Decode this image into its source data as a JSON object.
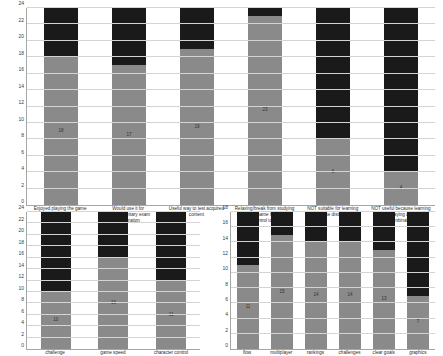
{
  "chart_data": [
    {
      "id": "perceptions",
      "type": "bar",
      "stacked": true,
      "title": "",
      "xlabel": "",
      "ylabel": "",
      "ylim": [
        0,
        24
      ],
      "ytick_step": 2,
      "yticks": [
        0,
        2,
        4,
        6,
        8,
        10,
        12,
        14,
        16,
        18,
        20,
        22,
        24
      ],
      "grid": true,
      "legend": "none",
      "categories": [
        "Enjoyed playing the game",
        "Would use it for complementary exam preparation",
        "Useful way to test acquired content",
        "Relaxing/break from studying but at the same time useful control tool",
        "NOT suitable for learning because distraction",
        "NOT useful because learning and playing are not combinable"
      ],
      "series": [
        {
          "name": "agree",
          "color": "#8a8a8a",
          "values": [
            18,
            17,
            19,
            23,
            8,
            4
          ],
          "labels": [
            "18",
            "17",
            "19",
            "23",
            "6",
            "4"
          ]
        },
        {
          "name": "remainder",
          "color": "#1a1a1a",
          "values": [
            6,
            7,
            5,
            1,
            16,
            20
          ],
          "labels": [
            "",
            "",
            "",
            "",
            "",
            ""
          ]
        }
      ]
    },
    {
      "id": "gameplay",
      "type": "bar",
      "stacked": true,
      "title": "",
      "xlabel": "",
      "ylabel": "",
      "ylim": [
        0,
        24
      ],
      "ytick_step": 2,
      "yticks": [
        0,
        2,
        4,
        6,
        8,
        10,
        12,
        14,
        16,
        18,
        20,
        22,
        24
      ],
      "grid": true,
      "legend": "none",
      "categories": [
        "challenge",
        "game speed",
        "character control"
      ],
      "series": [
        {
          "name": "agree",
          "color": "#8a8a8a",
          "values": [
            10,
            16,
            12
          ],
          "labels": [
            "10",
            "16",
            "11"
          ]
        },
        {
          "name": "remainder",
          "color": "#1a1a1a",
          "values": [
            14,
            8,
            12
          ],
          "labels": [
            "",
            "",
            ""
          ]
        }
      ]
    },
    {
      "id": "features",
      "type": "bar",
      "stacked": true,
      "title": "",
      "xlabel": "",
      "ylabel": "",
      "ylim": [
        0,
        18
      ],
      "ytick_step": 2,
      "yticks": [
        0,
        2,
        4,
        6,
        8,
        10,
        12,
        14,
        16,
        18
      ],
      "grid": true,
      "legend": "none",
      "categories": [
        "flow",
        "multiplayer",
        "rankings",
        "challenges",
        "clear goals",
        "graphics"
      ],
      "series": [
        {
          "name": "agree",
          "color": "#8a8a8a",
          "values": [
            11,
            15,
            14,
            14,
            13,
            7
          ],
          "labels": [
            "11",
            "15",
            "14",
            "14",
            "13",
            "7"
          ]
        },
        {
          "name": "remainder",
          "color": "#1a1a1a",
          "values": [
            7,
            3,
            4,
            4,
            5,
            11
          ],
          "labels": [
            "",
            "",
            "",
            "",
            "",
            ""
          ]
        }
      ]
    }
  ],
  "colors": {
    "series_gray": "#8a8a8a",
    "series_dark": "#1a1a1a",
    "gridline": "#d4d4d4",
    "axis": "#a6a6a6",
    "background": "#ffffff"
  }
}
